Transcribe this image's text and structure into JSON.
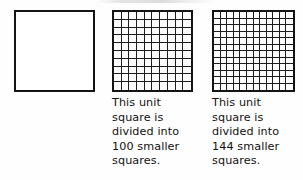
{
  "figure": {
    "background_color": "#fefefe",
    "line_color": "#141414",
    "text_color": "#121212"
  },
  "panels": [
    {
      "id": "plain",
      "square_label": "unit square",
      "rows": 1,
      "columns": 1,
      "subdivided": false,
      "caption": ""
    },
    {
      "id": "hundred",
      "square_label": "unit square divided into 100 smaller squares",
      "rows": 10,
      "columns": 10,
      "subdivided": true,
      "cell_count": 100,
      "caption": "This unit\nsquare is\ndivided into\n100 smaller\nsquares."
    },
    {
      "id": "onefortyfour",
      "square_label": "unit square divided into 144 smaller squares",
      "rows": 12,
      "columns": 12,
      "subdivided": true,
      "cell_count": 144,
      "caption": "This unit\nsquare is\ndivided into\n144 smaller\nsquares."
    }
  ]
}
